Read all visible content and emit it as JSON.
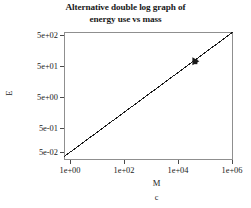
{
  "chart_data": {
    "type": "line",
    "title": "Alternative double log graph of energy use vs mass",
    "title_lines": [
      "Alternative double log graph of",
      "energy use vs mass"
    ],
    "caption": "c",
    "xlabel": "M",
    "ylabel": "E",
    "xscale": "log",
    "yscale": "log",
    "grid": false,
    "legend": "none",
    "xlim": [
      1,
      1000000
    ],
    "ylim": [
      0.02,
      1000
    ],
    "xticks": [
      {
        "value": 1,
        "label": "1e+00"
      },
      {
        "value": 100,
        "label": "1e+02"
      },
      {
        "value": 10000,
        "label": "1e+04"
      },
      {
        "value": 1000000,
        "label": "1e+06"
      }
    ],
    "yticks": [
      {
        "value": 500,
        "label": "5e+02"
      },
      {
        "value": 50,
        "label": "5e+01"
      },
      {
        "value": 5,
        "label": "5e+00"
      },
      {
        "value": 0.5,
        "label": "5e-01"
      },
      {
        "value": 0.05,
        "label": "5e-02"
      }
    ],
    "series": [
      {
        "name": "energy use vs mass",
        "type": "line",
        "color": "#1a1a1a",
        "slope_loglog": 0.75,
        "x": [
          1,
          1000000
        ],
        "y": [
          0.0265,
          1000
        ],
        "markers": [
          {
            "x": 50000,
            "y": 85,
            "label": ""
          }
        ]
      }
    ]
  }
}
